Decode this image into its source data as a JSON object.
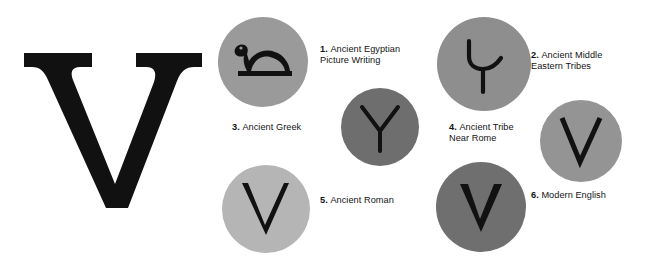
{
  "figure": {
    "hero": {
      "letter": "V",
      "name": "large-serif-letter-v",
      "color": "#111111"
    },
    "stages": [
      {
        "id": 1,
        "number": "1.",
        "label": "Ancient Egyptian\nPicture Writing",
        "glyph_name": "egyptian-horned-viper-hieroglyph",
        "circle_color": "#9a9a9a",
        "glyph_color": "#111111",
        "position": {
          "left": 218,
          "top": 17,
          "size": 90
        },
        "caption_class": "cap-1"
      },
      {
        "id": 2,
        "number": "2.",
        "label": "Ancient Middle\nEastern Tribes",
        "glyph_name": "hooked-y-glyph",
        "circle_color": "#8e8e8e",
        "glyph_color": "#111111",
        "position": {
          "left": 437,
          "top": 17,
          "size": 94
        },
        "caption_class": "cap-2"
      },
      {
        "id": 3,
        "number": "3.",
        "label": "Ancient Greek",
        "glyph_name": "greek-upsilon-glyph",
        "circle_color": "#6e6e6e",
        "glyph_color": "#111111",
        "position": {
          "left": 341,
          "top": 88,
          "size": 78
        },
        "caption_class": "cap-3"
      },
      {
        "id": 4,
        "number": "4.",
        "label": "Ancient Tribe\nNear Rome",
        "glyph_name": "angular-v-glyph",
        "circle_color": "#949494",
        "glyph_color": "#111111",
        "position": {
          "left": 540,
          "top": 100,
          "size": 82
        },
        "caption_class": "cap-4"
      },
      {
        "id": 5,
        "number": "5.",
        "label": "Ancient Roman",
        "glyph_name": "roman-capital-v-glyph",
        "circle_color": "#b5b5b5",
        "glyph_color": "#111111",
        "position": {
          "left": 222,
          "top": 165,
          "size": 88
        },
        "caption_class": "cap-5"
      },
      {
        "id": 6,
        "number": "6.",
        "label": "Modern English",
        "glyph_name": "modern-v-glyph",
        "circle_color": "#6f6f6f",
        "glyph_color": "#111111",
        "position": {
          "left": 436,
          "top": 162,
          "size": 90
        },
        "caption_class": "cap-6"
      }
    ]
  }
}
